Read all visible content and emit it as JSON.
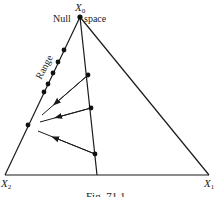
{
  "figure": {
    "caption": "Fig. 71.1",
    "colors": {
      "ink": "#1a1a1a",
      "background": "#ffffff"
    },
    "vertices": {
      "top": {
        "label": "X",
        "subscript": "0"
      },
      "bottom_left": {
        "label": "X",
        "subscript": "2"
      },
      "bottom_right": {
        "label": "X",
        "subscript": "1"
      }
    },
    "labels": {
      "null_left": "Null",
      "null_right": "space",
      "range": "Range"
    },
    "range_line_dots": 6,
    "null_space_line_dots": 3,
    "arrows": 3
  }
}
